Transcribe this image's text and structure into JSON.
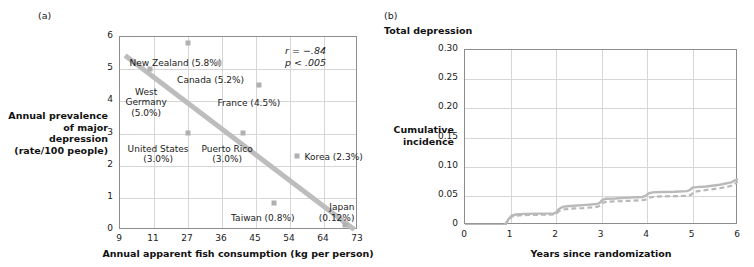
{
  "figure": {
    "panel_a_letter": "(a)",
    "panel_b_letter": "(b)",
    "panel_b_title": "Total depression"
  },
  "chart_data": [
    {
      "type": "scatter",
      "panel": "(a)",
      "title": "",
      "xlabel": "Annual apparent fish consumption (kg per person)",
      "ylabel": "Annual prevalence\nof major depression\n(rate/100 people)",
      "ylabel_lines": [
        "Annual prevalence",
        "of major depression",
        "(rate/100 people)"
      ],
      "xticks": [
        "9",
        "11",
        "27",
        "36",
        "45",
        "54",
        "64",
        "73"
      ],
      "yticks": [
        "0",
        "1",
        "2",
        "3",
        "4",
        "5",
        "6"
      ],
      "xlim": [
        9,
        73
      ],
      "ylim": [
        0,
        6
      ],
      "grid": true,
      "annotation_lines": [
        "r = −.84",
        "p < .005"
      ],
      "annotation_r": "r = −.84",
      "annotation_p": "p < .005",
      "trendline": {
        "x0": 9.3,
        "y0": 5.42,
        "x1": 67.5,
        "y1": 0.0,
        "color": "#bdbdbd"
      },
      "points": [
        {
          "country": "New Zealand",
          "label": "New Zealand (5.8%)",
          "rate": 5.8,
          "fish": 11.0,
          "px": 0.285,
          "py": 5.82,
          "label_anchor": "left",
          "lx": 0.04,
          "ly": 5.35
        },
        {
          "country": "Canada",
          "label": "Canada (5.2%)",
          "rate": 5.2,
          "fish": 18.0,
          "px": 0.415,
          "py": 5.2,
          "label_anchor": "left",
          "lx": 0.24,
          "ly": 4.82
        },
        {
          "country": "West Germany",
          "label": "West\nGermany\n(5.0%)",
          "label_lines": [
            "West",
            "Germany",
            "(5.0%)"
          ],
          "rate": 5.0,
          "fish": 10.0,
          "px": 0.125,
          "py": 5.02,
          "label_anchor": "center",
          "lx": 0.11,
          "ly": 4.46
        },
        {
          "country": "France",
          "label": "France (4.5%)",
          "rate": 4.5,
          "fish": 29.0,
          "px": 0.585,
          "py": 4.5,
          "label_anchor": "left",
          "lx": 0.41,
          "ly": 4.1
        },
        {
          "country": "United States",
          "label": "United States\n(3.0%)",
          "label_lines": [
            "United States",
            "(3.0%)"
          ],
          "rate": 3.0,
          "fish": 18.0,
          "px": 0.285,
          "py": 3.02,
          "label_anchor": "center",
          "lx": 0.16,
          "ly": 2.68
        },
        {
          "country": "Puerto Rico",
          "label": "Puerto Rico\n(3.0%)",
          "label_lines": [
            "Puerto Rico",
            "(3.0%)"
          ],
          "rate": 3.0,
          "fish": 30.0,
          "px": 0.515,
          "py": 3.02,
          "label_anchor": "center",
          "lx": 0.45,
          "ly": 2.68
        },
        {
          "country": "Korea",
          "label": "Korea (2.3%)",
          "rate": 2.3,
          "fish": 48.0,
          "px": 0.745,
          "py": 2.3,
          "label_anchor": "left",
          "lx": 0.775,
          "ly": 2.42
        },
        {
          "country": "Taiwan",
          "label": "Taiwan (0.8%)",
          "rate": 0.8,
          "fish": 37.0,
          "px": 0.645,
          "py": 0.84,
          "label_anchor": "center",
          "lx": 0.6,
          "ly": 0.52
        },
        {
          "country": "Japan",
          "label": "Japan\n(0.12%)",
          "label_lines": [
            "Japan",
            "(0.12%)"
          ],
          "rate": 0.12,
          "fish": 67.0,
          "px": 0.945,
          "py": 0.14,
          "label_anchor": "right",
          "lx": 0.985,
          "ly": 0.86
        }
      ]
    },
    {
      "type": "line",
      "panel": "(b)",
      "title": "Total depression",
      "xlabel": "Years since randomization",
      "ylabel": "Cumulative\nincidence",
      "ylabel_lines": [
        "Cumulative",
        "incidence"
      ],
      "xticks": [
        "0",
        "1",
        "2",
        "3",
        "4",
        "5",
        "6"
      ],
      "yticks": [
        "0",
        "0.05",
        "0.10",
        "0.15",
        "0.20",
        "0.25",
        "0.30"
      ],
      "xlim": [
        0,
        6
      ],
      "ylim": [
        0,
        0.3
      ],
      "grid": true,
      "legend": "none",
      "series": [
        {
          "name": "solid-curve",
          "style": "solid",
          "color": "#b9b9b9",
          "x": [
            0.0,
            0.88,
            0.92,
            1.02,
            1.12,
            1.3,
            1.6,
            1.95,
            2.0,
            2.06,
            2.14,
            2.3,
            2.6,
            2.9,
            2.96,
            3.02,
            3.1,
            3.3,
            3.6,
            3.9,
            3.97,
            4.03,
            4.12,
            4.3,
            4.6,
            4.88,
            4.94,
            5.0,
            5.08,
            5.3,
            5.6,
            5.85,
            6.0
          ],
          "y": [
            0.0,
            0.0,
            0.006,
            0.016,
            0.018,
            0.019,
            0.0195,
            0.02,
            0.021,
            0.027,
            0.031,
            0.0325,
            0.034,
            0.036,
            0.038,
            0.043,
            0.045,
            0.0455,
            0.047,
            0.048,
            0.05,
            0.054,
            0.056,
            0.0565,
            0.057,
            0.058,
            0.06,
            0.064,
            0.065,
            0.066,
            0.069,
            0.073,
            0.079
          ]
        },
        {
          "name": "dashed-curve",
          "style": "dashed",
          "color": "#b9b9b9",
          "x": [
            0.0,
            0.88,
            0.93,
            1.03,
            1.13,
            1.3,
            1.6,
            1.95,
            2.0,
            2.07,
            2.16,
            2.3,
            2.6,
            2.9,
            2.97,
            3.04,
            3.13,
            3.3,
            3.6,
            3.9,
            3.99,
            4.06,
            4.15,
            4.3,
            4.6,
            4.9,
            4.97,
            5.04,
            5.12,
            5.3,
            5.6,
            5.85,
            6.0
          ],
          "y": [
            0.0,
            0.0,
            0.005,
            0.0145,
            0.016,
            0.017,
            0.0175,
            0.018,
            0.019,
            0.024,
            0.0265,
            0.028,
            0.029,
            0.031,
            0.033,
            0.0385,
            0.04,
            0.0405,
            0.0415,
            0.0425,
            0.044,
            0.047,
            0.0485,
            0.049,
            0.0495,
            0.05,
            0.052,
            0.057,
            0.058,
            0.06,
            0.063,
            0.067,
            0.074
          ]
        }
      ]
    }
  ]
}
